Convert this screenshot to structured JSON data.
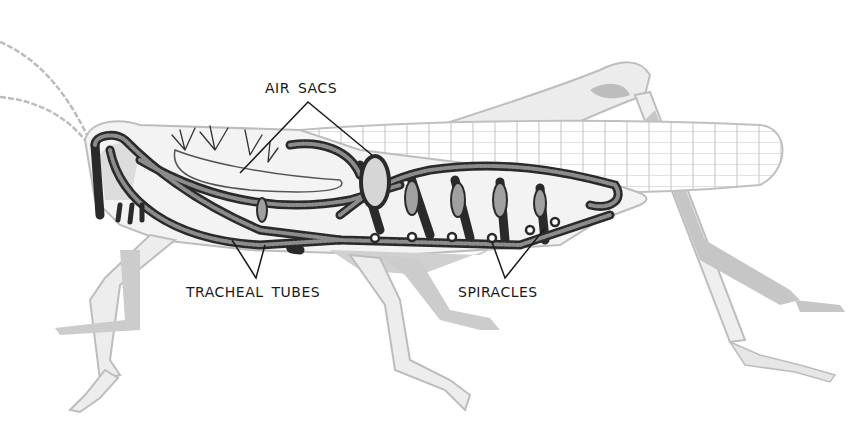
{
  "diagram": {
    "labels": {
      "air_sacs": "AIR SACS",
      "tracheal_tubes": "TRACHEAL TUBES",
      "spiracles": "SPIRACLES"
    },
    "colors": {
      "background": "#ffffff",
      "body_outline": "#bdbdbd",
      "body_shadow": "#c8c8c8",
      "trachea": "#2a2a2a",
      "label_text": "#1a1a1a",
      "leader_line": "#1a1a1a"
    }
  }
}
